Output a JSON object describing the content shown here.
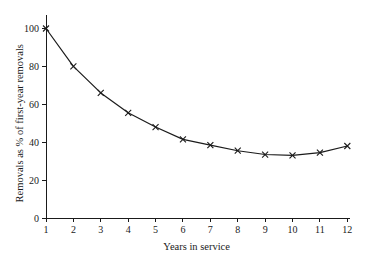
{
  "chart_data": {
    "type": "line",
    "title": "",
    "xlabel": "Years in service",
    "ylabel": "Removals as % of first-year removals",
    "x": [
      1,
      2,
      3,
      4,
      5,
      6,
      7,
      8,
      9,
      10,
      11,
      12
    ],
    "values": [
      100,
      80,
      66,
      55.5,
      48,
      41.5,
      38.5,
      35.5,
      33.5,
      33,
      34.5,
      38
    ],
    "series": [
      {
        "name": "Removals",
        "values": [
          100,
          80,
          66,
          55.5,
          48,
          41.5,
          38.5,
          35.5,
          33.5,
          33,
          34.5,
          38
        ]
      }
    ],
    "xlim": [
      1,
      12
    ],
    "ylim": [
      0,
      100
    ],
    "xticks": [
      1,
      2,
      3,
      4,
      5,
      6,
      7,
      8,
      9,
      10,
      11,
      12
    ],
    "xticklabels": [
      "1",
      "2",
      "3",
      "4",
      "5",
      "6",
      "7",
      "8",
      "9",
      "10",
      "11",
      "12"
    ],
    "yticks": [
      0,
      20,
      40,
      60,
      80,
      100
    ],
    "yticklabels": [
      "0",
      "20",
      "40",
      "60",
      "80",
      "100"
    ],
    "grid": false,
    "legend": false,
    "marker": "x",
    "line_color": "#1b1b1b",
    "marker_color": "#1b1b1b",
    "background_color": "#ffffff",
    "axis_color": "#1a1a1a"
  }
}
